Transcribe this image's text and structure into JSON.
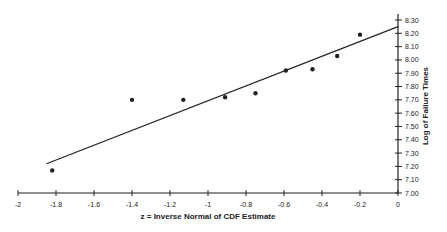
{
  "chart_data": {
    "type": "scatter",
    "title": "",
    "xlabel": "z = Inverse Normal of CDF Estimate",
    "ylabel": "Log of Failure Times",
    "xlim": [
      -2,
      0
    ],
    "ylim": [
      7.0,
      8.3
    ],
    "x_ticks": [
      "-2",
      "-1.8",
      "-1.6",
      "-1.4",
      "-1.2",
      "-1",
      "-0.8",
      "-0.6",
      "-0.4",
      "-0.2",
      "0"
    ],
    "y_ticks": [
      "7.00",
      "7.10",
      "7.20",
      "7.30",
      "7.40",
      "7.50",
      "7.60",
      "7.70",
      "7.80",
      "7.90",
      "8.00",
      "8.10",
      "8.20",
      "8.30"
    ],
    "grid": false,
    "legend": null,
    "y_axis_position": "right",
    "series": [
      {
        "name": "Observed",
        "type": "scatter",
        "x": [
          -1.82,
          -1.4,
          -1.13,
          -0.91,
          -0.75,
          -0.59,
          -0.45,
          -0.32,
          -0.2
        ],
        "y": [
          7.17,
          7.7,
          7.7,
          7.72,
          7.75,
          7.92,
          7.93,
          8.03,
          8.19
        ]
      },
      {
        "name": "Fitted line",
        "type": "line",
        "x": [
          -1.85,
          0
        ],
        "y": [
          7.22,
          8.25
        ]
      }
    ]
  },
  "colors": {
    "ink": "#222222",
    "background": "#ffffff"
  }
}
